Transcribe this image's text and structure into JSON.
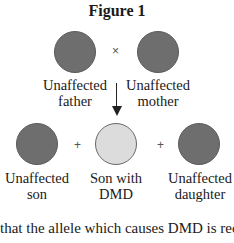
{
  "figure": {
    "title": "Figure 1",
    "parents": {
      "father": {
        "label_line1": "Unaffected",
        "label_line2": "father",
        "status": "unaffected"
      },
      "cross_symbol": "×",
      "mother": {
        "label_line1": "Unaffected",
        "label_line2": "mother",
        "status": "unaffected"
      }
    },
    "offspring": {
      "son": {
        "label_line1": "Unaffected",
        "label_line2": "son",
        "status": "unaffected"
      },
      "plus1": "+",
      "affected_son": {
        "label_line1": "Son with",
        "label_line2": "DMD",
        "status": "affected"
      },
      "plus2": "+",
      "daughter": {
        "label_line1": "Unaffected",
        "label_line2": "daughter",
        "status": "unaffected"
      }
    },
    "colors": {
      "unaffected": "#6e6e6e",
      "affected": "#dcdcdc"
    }
  },
  "caption": "that the allele which causes DMD is reces"
}
